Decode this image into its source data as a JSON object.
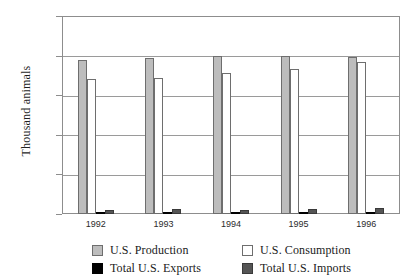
{
  "chart_data": {
    "type": "bar",
    "title": "",
    "xlabel": "",
    "ylabel": "Thousand animals",
    "categories": [
      "1992",
      "1993",
      "1994",
      "1995",
      "1996"
    ],
    "ylim": [
      0,
      50000
    ],
    "yticks": [
      0,
      10000,
      20000,
      30000,
      40000,
      50000
    ],
    "ytick_labels": [
      "0",
      "10,000",
      "20,000",
      "30,000",
      "40,000",
      "50,000"
    ],
    "grid": true,
    "legend_position": "bottom",
    "series": [
      {
        "name": "U.S. Production",
        "color": "#bdbdbd",
        "values": [
          38900,
          39300,
          39900,
          40000,
          39700
        ]
      },
      {
        "name": "U.S. Consumption",
        "color": "#ffffff",
        "values": [
          34100,
          34400,
          35500,
          36700,
          38400
        ]
      },
      {
        "name": "Total U.S. Exports",
        "color": "#000000",
        "values": [
          400,
          500,
          500,
          500,
          500
        ]
      },
      {
        "name": "Total U.S. Imports",
        "color": "#555555",
        "values": [
          1100,
          1200,
          1100,
          1300,
          1500
        ]
      }
    ]
  },
  "axis": {
    "ylabel": "Thousand animals"
  },
  "legend": {
    "items": [
      {
        "label": "U.S. Production",
        "swatch": "production"
      },
      {
        "label": "U.S. Consumption",
        "swatch": "consumption"
      },
      {
        "label": "Total U.S. Exports",
        "swatch": "exports"
      },
      {
        "label": "Total U.S. Imports",
        "swatch": "imports"
      }
    ]
  }
}
